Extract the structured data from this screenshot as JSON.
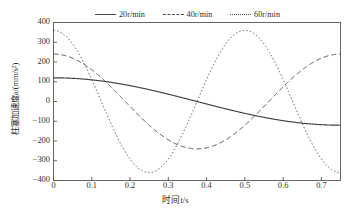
{
  "chart_data": {
    "type": "line",
    "title": "",
    "xlabel": "时间t/s",
    "ylabel": "柱塞加速度a/(mm/s²)",
    "xlim": [
      0,
      0.75
    ],
    "ylim": [
      -400,
      400
    ],
    "xticks": [
      "0",
      "0.1",
      "0.2",
      "0.3",
      "0.4",
      "0.5",
      "0.6",
      "0.7"
    ],
    "xtick_values": [
      0,
      0.1,
      0.2,
      0.3,
      0.4,
      0.5,
      0.6,
      0.7
    ],
    "yticks": [
      "400",
      "300",
      "200",
      "100",
      "0",
      "−100",
      "−200",
      "−300",
      "−400"
    ],
    "ytick_values": [
      400,
      300,
      200,
      100,
      0,
      -100,
      -200,
      -300,
      -400
    ],
    "grid": false,
    "legend_position": "top",
    "series": [
      {
        "name": "20r/min",
        "style": "solid",
        "color": "#404040",
        "amplitude": 120,
        "period": 1.5,
        "phase": 0,
        "description": "a = 120·cos(2π t / 1.5)",
        "points": [
          {
            "x": 0.0,
            "y": 120
          },
          {
            "x": 0.05,
            "y": 117
          },
          {
            "x": 0.1,
            "y": 110
          },
          {
            "x": 0.15,
            "y": 97
          },
          {
            "x": 0.2,
            "y": 80
          },
          {
            "x": 0.25,
            "y": 60
          },
          {
            "x": 0.3,
            "y": 37
          },
          {
            "x": 0.35,
            "y": 13
          },
          {
            "x": 0.375,
            "y": 0
          },
          {
            "x": 0.4,
            "y": -13
          },
          {
            "x": 0.45,
            "y": -37
          },
          {
            "x": 0.5,
            "y": -60
          },
          {
            "x": 0.55,
            "y": -80
          },
          {
            "x": 0.6,
            "y": -97
          },
          {
            "x": 0.65,
            "y": -110
          },
          {
            "x": 0.7,
            "y": -117
          },
          {
            "x": 0.75,
            "y": -120
          }
        ]
      },
      {
        "name": "40r/min",
        "style": "dashed",
        "color": "#404040",
        "amplitude": 240,
        "period": 0.75,
        "phase": 0,
        "description": "a = 240·cos(2π t / 0.75)",
        "points": [
          {
            "x": 0.0,
            "y": 240
          },
          {
            "x": 0.05,
            "y": 191
          },
          {
            "x": 0.1,
            "y": 74
          },
          {
            "x": 0.15,
            "y": -74
          },
          {
            "x": 0.1875,
            "y": -240
          },
          {
            "x": 0.25,
            "y": -194
          },
          {
            "x": 0.3,
            "y": -74
          },
          {
            "x": 0.35,
            "y": 74
          },
          {
            "x": 0.375,
            "y": 240
          },
          {
            "x": 0.45,
            "y": 194
          },
          {
            "x": 0.5,
            "y": 74
          },
          {
            "x": 0.55,
            "y": -74
          },
          {
            "x": 0.5625,
            "y": -240
          },
          {
            "x": 0.65,
            "y": -194
          },
          {
            "x": 0.7,
            "y": 0
          },
          {
            "x": 0.75,
            "y": 240
          }
        ]
      },
      {
        "name": "60r/min",
        "style": "dotted",
        "color": "#404040",
        "amplitude": 360,
        "period": 0.5,
        "phase": 0,
        "description": "a = 360·cos(2π t / 0.5)",
        "points": [
          {
            "x": 0.0,
            "y": 360
          },
          {
            "x": 0.0625,
            "y": 0
          },
          {
            "x": 0.125,
            "y": -360
          },
          {
            "x": 0.1875,
            "y": 0
          },
          {
            "x": 0.25,
            "y": 360
          },
          {
            "x": 0.3125,
            "y": 0
          },
          {
            "x": 0.375,
            "y": -360
          },
          {
            "x": 0.4375,
            "y": 0
          },
          {
            "x": 0.5,
            "y": 360
          },
          {
            "x": 0.5625,
            "y": 0
          },
          {
            "x": 0.625,
            "y": -360
          },
          {
            "x": 0.6875,
            "y": 0
          },
          {
            "x": 0.75,
            "y": 360
          }
        ]
      }
    ]
  },
  "legend": {
    "entries": [
      {
        "label": "20r/min",
        "style": "solid"
      },
      {
        "label": "40r/min",
        "style": "dashed"
      },
      {
        "label": "60r/min",
        "style": "dotted"
      }
    ]
  }
}
